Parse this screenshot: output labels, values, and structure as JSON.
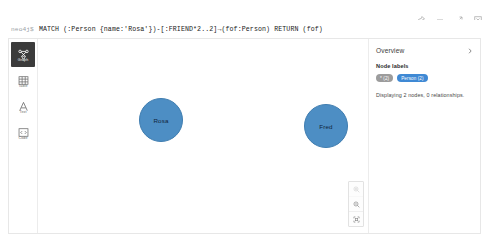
{
  "window": {
    "frame_controls_top": [
      {
        "name": "pin-icon",
        "label": "Pin"
      },
      {
        "name": "minimize-icon",
        "label": "Minimize"
      },
      {
        "name": "expand-icon",
        "label": "Expand"
      },
      {
        "name": "close-icon",
        "label": "Close"
      }
    ],
    "frame_controls_row2": [
      {
        "name": "run-icon",
        "label": "Run"
      },
      {
        "name": "save-icon",
        "label": "Save as favorite"
      },
      {
        "name": "download-icon",
        "label": "Download"
      }
    ]
  },
  "editor": {
    "prompt": "neo4j$",
    "query": "MATCH (:Person {name:'Rosa'})-[:FRIEND*2..2]→(fof:Person) RETURN (fof)"
  },
  "view_rail": {
    "items": [
      {
        "label": "Graph",
        "icon": "graph-icon",
        "active": true
      },
      {
        "label": "Table",
        "icon": "table-icon",
        "active": false
      },
      {
        "label": "Text",
        "icon": "text-icon",
        "active": false
      },
      {
        "label": "Code",
        "icon": "code-icon",
        "active": false
      }
    ]
  },
  "graph": {
    "nodes": [
      {
        "label": "Rosa",
        "color": "#4d8ec4",
        "x": 101,
        "y": 59,
        "size": 44
      },
      {
        "label": "Fred",
        "color": "#4d8ec4",
        "x": 266,
        "y": 65,
        "size": 44
      }
    ],
    "relationships": [],
    "zoom_controls": [
      {
        "name": "zoom-in-button",
        "label": "Zoom in",
        "disabled": true
      },
      {
        "name": "zoom-out-button",
        "label": "Zoom out",
        "disabled": false
      },
      {
        "name": "zoom-fit-button",
        "label": "Fit to screen",
        "disabled": false
      }
    ]
  },
  "overview": {
    "title": "Overview",
    "collapse_label": "Collapse panel",
    "node_labels_heading": "Node labels",
    "chips": [
      {
        "text": "* (2)",
        "kind": "all",
        "color": "#9c9c9c"
      },
      {
        "text": "Person (2)",
        "kind": "person",
        "color": "#3f89d4"
      }
    ],
    "status": "Displaying 2 nodes, 0 relationships."
  }
}
